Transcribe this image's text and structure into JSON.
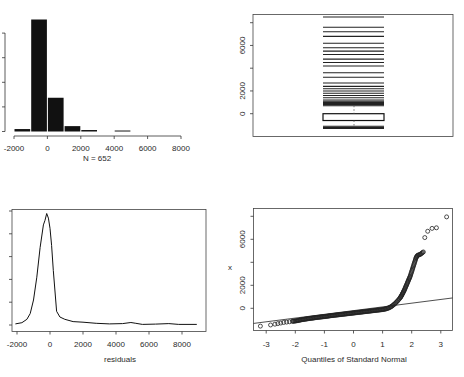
{
  "figure": {
    "panels": 4,
    "background": "#ffffff",
    "ink_color": "#1a1a1a"
  },
  "chart_data": [
    {
      "id": "histogram",
      "type": "bar",
      "title": "",
      "xlabel": "N = 652",
      "ylabel": "",
      "xlim": [
        -2000,
        8000
      ],
      "x_ticks": [
        -2000,
        0,
        2000,
        4000,
        6000,
        8000
      ],
      "x_tick_labels": [
        "-2000",
        "0",
        "2000",
        "4000",
        "6000",
        "8000"
      ],
      "y_ticks_count": 5,
      "y_tick_labels_visible": false,
      "bin_width": 1000,
      "bins": [
        {
          "from": -2000,
          "to": -1000,
          "count": 10
        },
        {
          "from": -1000,
          "to": 0,
          "count": 458
        },
        {
          "from": 0,
          "to": 1000,
          "count": 138
        },
        {
          "from": 1000,
          "to": 2000,
          "count": 22
        },
        {
          "from": 2000,
          "to": 3000,
          "count": 6
        },
        {
          "from": 3000,
          "to": 4000,
          "count": 0
        },
        {
          "from": 4000,
          "to": 5000,
          "count": 4
        },
        {
          "from": 5000,
          "to": 6000,
          "count": 0
        },
        {
          "from": 6000,
          "to": 7000,
          "count": 0
        },
        {
          "from": 7000,
          "to": 8000,
          "count": 0
        }
      ],
      "grid": false
    },
    {
      "id": "boxplot",
      "type": "box",
      "title": "",
      "ylabel": "",
      "ylim": [
        -1500,
        8500
      ],
      "y_ticks": [
        0,
        2000,
        4000,
        6000,
        8000
      ],
      "y_tick_labels": [
        "0",
        "2000",
        "",
        "6000",
        ""
      ],
      "box": {
        "q1": -600,
        "median": -300,
        "q3": 0
      },
      "whisker_low": -1100,
      "whisker_high": 700,
      "outlier_lines": [
        -1300,
        -1200,
        -1100,
        700,
        800,
        900,
        1000,
        1100,
        1200,
        1400,
        1600,
        1800,
        2000,
        2200,
        2400,
        2700,
        3200,
        3600,
        4200,
        4500,
        4800,
        5200,
        5500,
        5800,
        6200,
        6800,
        7200,
        7600,
        8500
      ],
      "grid": false
    },
    {
      "id": "density",
      "type": "line",
      "title": "",
      "xlabel": "residuals",
      "ylabel": "",
      "xlim": [
        -2200,
        9200
      ],
      "x_ticks": [
        -2000,
        0,
        2000,
        4000,
        6000,
        8000
      ],
      "x_tick_labels": [
        "-2000",
        "0",
        "2000",
        "4000",
        "6000",
        "8000"
      ],
      "y_ticks_count": 6,
      "y_tick_labels_visible": false,
      "x": [
        -2100,
        -1700,
        -1400,
        -1200,
        -1000,
        -800,
        -600,
        -400,
        -300,
        -200,
        -100,
        0,
        100,
        200,
        400,
        600,
        900,
        1400,
        2000,
        2800,
        3600,
        4400,
        4900,
        5200,
        5600,
        6400,
        7200,
        7800,
        8900
      ],
      "y": [
        0.01,
        0.02,
        0.05,
        0.1,
        0.22,
        0.42,
        0.68,
        0.88,
        0.92,
        0.98,
        0.94,
        0.85,
        0.7,
        0.48,
        0.12,
        0.07,
        0.05,
        0.03,
        0.025,
        0.015,
        0.01,
        0.012,
        0.022,
        0.015,
        0.005,
        0.008,
        0.012,
        0.005,
        0.005
      ],
      "grid": false
    },
    {
      "id": "qqnorm",
      "type": "scatter",
      "title": "",
      "xlabel": "Quantiles of Standard Normal",
      "ylabel": "x",
      "xlim": [
        -3.4,
        3.4
      ],
      "ylim": [
        -1600,
        8400
      ],
      "x_ticks": [
        -3,
        -2,
        -1,
        0,
        1,
        2,
        3
      ],
      "x_tick_labels": [
        "-3",
        "-2",
        "-1",
        "0",
        "1",
        "2",
        "3"
      ],
      "y_ticks": [
        0,
        2000,
        4000,
        6000,
        8000
      ],
      "y_tick_labels": [
        "0",
        "2000",
        "",
        "6000",
        ""
      ],
      "reference_line": {
        "x1": -3.4,
        "y1": -1300,
        "x2": 3.4,
        "y2": 900
      },
      "points": [
        [
          -3.2,
          -1550
        ],
        [
          -2.85,
          -1450
        ],
        [
          -2.7,
          -1380
        ],
        [
          -2.6,
          -1330
        ],
        [
          -2.5,
          -1280
        ],
        [
          -2.4,
          -1230
        ],
        [
          -2.3,
          -1200
        ],
        [
          -2.2,
          -1170
        ],
        [
          -2.1,
          -1130
        ],
        [
          -2.0,
          -1100
        ],
        [
          -1.9,
          -1060
        ],
        [
          -1.8,
          -1000
        ],
        [
          -1.7,
          -960
        ],
        [
          -1.6,
          -920
        ],
        [
          -1.5,
          -880
        ],
        [
          -1.4,
          -850
        ],
        [
          -1.3,
          -810
        ],
        [
          -1.2,
          -780
        ],
        [
          -1.1,
          -750
        ],
        [
          -1.0,
          -720
        ],
        [
          -0.9,
          -690
        ],
        [
          -0.8,
          -650
        ],
        [
          -0.7,
          -620
        ],
        [
          -0.6,
          -590
        ],
        [
          -0.5,
          -560
        ],
        [
          -0.4,
          -530
        ],
        [
          -0.3,
          -500
        ],
        [
          -0.2,
          -470
        ],
        [
          -0.1,
          -440
        ],
        [
          0.0,
          -410
        ],
        [
          0.1,
          -380
        ],
        [
          0.2,
          -350
        ],
        [
          0.3,
          -320
        ],
        [
          0.4,
          -290
        ],
        [
          0.5,
          -260
        ],
        [
          0.6,
          -230
        ],
        [
          0.7,
          -200
        ],
        [
          0.8,
          -170
        ],
        [
          0.9,
          -140
        ],
        [
          1.0,
          -110
        ],
        [
          1.1,
          -60
        ],
        [
          1.2,
          20
        ],
        [
          1.3,
          150
        ],
        [
          1.4,
          350
        ],
        [
          1.5,
          600
        ],
        [
          1.6,
          900
        ],
        [
          1.65,
          1100
        ],
        [
          1.7,
          1350
        ],
        [
          1.75,
          1600
        ],
        [
          1.8,
          1900
        ],
        [
          1.85,
          2200
        ],
        [
          1.9,
          2500
        ],
        [
          1.95,
          2800
        ],
        [
          2.0,
          3200
        ],
        [
          2.05,
          3600
        ],
        [
          2.1,
          4000
        ],
        [
          2.15,
          4400
        ],
        [
          2.2,
          4600
        ],
        [
          2.3,
          4700
        ],
        [
          2.4,
          4900
        ],
        [
          2.45,
          6150
        ],
        [
          2.55,
          6700
        ],
        [
          2.7,
          6950
        ],
        [
          2.85,
          7000
        ],
        [
          3.2,
          7950
        ]
      ],
      "grid": false
    }
  ]
}
